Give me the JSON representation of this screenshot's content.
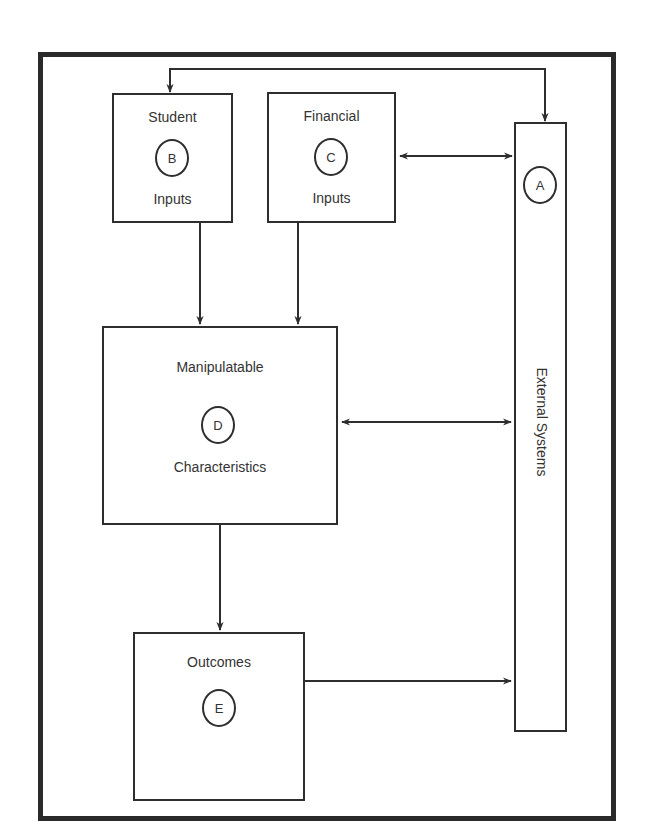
{
  "diagram": {
    "type": "systems-model",
    "nodes": {
      "external": {
        "id": "A",
        "label": "External Systems"
      },
      "student": {
        "id": "B",
        "title": "Student",
        "subtitle": "Inputs"
      },
      "financial": {
        "id": "C",
        "title": "Financial",
        "subtitle": "Inputs"
      },
      "manipulatable": {
        "id": "D",
        "title": "Manipulatable",
        "subtitle": "Characteristics"
      },
      "outcomes": {
        "id": "E",
        "title": "Outcomes"
      }
    },
    "edges": [
      {
        "from": "A",
        "to": "B",
        "direction": "bidirectional",
        "route": "top"
      },
      {
        "from": "C",
        "to": "A",
        "direction": "bidirectional"
      },
      {
        "from": "B",
        "to": "D",
        "direction": "forward"
      },
      {
        "from": "C",
        "to": "D",
        "direction": "forward"
      },
      {
        "from": "D",
        "to": "A",
        "direction": "bidirectional"
      },
      {
        "from": "D",
        "to": "E",
        "direction": "forward"
      },
      {
        "from": "E",
        "to": "A",
        "direction": "forward"
      }
    ],
    "colors": {
      "line": "#2e2e2e",
      "frame": "#2a2a2a",
      "background": "#ffffff"
    }
  }
}
